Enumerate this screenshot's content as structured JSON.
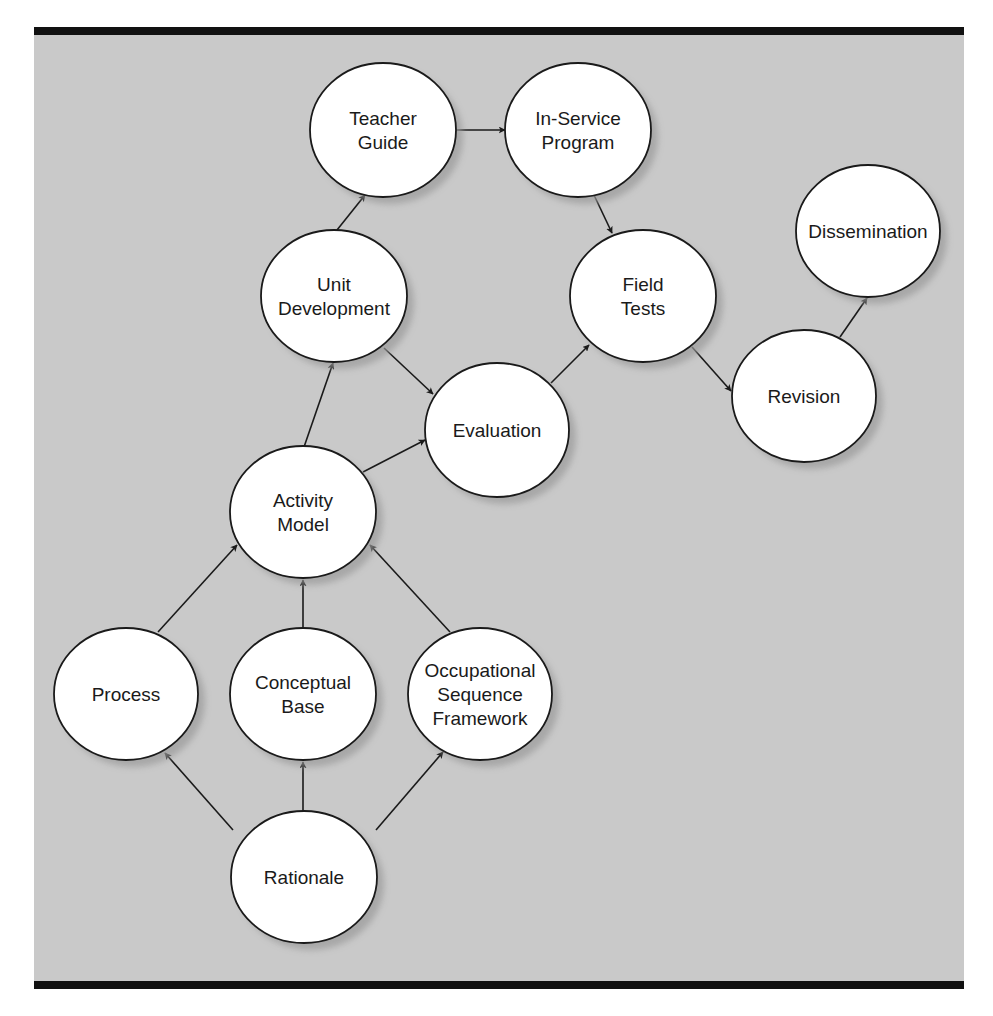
{
  "diagram": {
    "type": "flow-diagram",
    "colors": {
      "background": "#c9c9c9",
      "frame_bar": "#111111",
      "node_fill": "#ffffff",
      "node_stroke": "#1a1a1a",
      "shadow": "#9a9a9a",
      "arrow": "#1a1a1a"
    },
    "nodes": [
      {
        "id": "teacher-guide",
        "lines": [
          "Teacher",
          "Guide"
        ],
        "cx": 383,
        "cy": 130,
        "rx": 73,
        "ry": 67
      },
      {
        "id": "in-service-program",
        "lines": [
          "In-Service",
          "Program"
        ],
        "cx": 578,
        "cy": 130,
        "rx": 73,
        "ry": 67
      },
      {
        "id": "dissemination",
        "lines": [
          "Dissemination"
        ],
        "cx": 868,
        "cy": 231,
        "rx": 72,
        "ry": 66
      },
      {
        "id": "unit-development",
        "lines": [
          "Unit",
          "Development"
        ],
        "cx": 334,
        "cy": 296,
        "rx": 73,
        "ry": 66
      },
      {
        "id": "field-tests",
        "lines": [
          "Field",
          "Tests"
        ],
        "cx": 643,
        "cy": 296,
        "rx": 73,
        "ry": 66
      },
      {
        "id": "revision",
        "lines": [
          "Revision"
        ],
        "cx": 804,
        "cy": 396,
        "rx": 72,
        "ry": 66
      },
      {
        "id": "evaluation",
        "lines": [
          "Evaluation"
        ],
        "cx": 497,
        "cy": 430,
        "rx": 72,
        "ry": 67
      },
      {
        "id": "activity-model",
        "lines": [
          "Activity",
          "Model"
        ],
        "cx": 303,
        "cy": 512,
        "rx": 73,
        "ry": 66
      },
      {
        "id": "process",
        "lines": [
          "Process"
        ],
        "cx": 126,
        "cy": 694,
        "rx": 72,
        "ry": 66
      },
      {
        "id": "conceptual-base",
        "lines": [
          "Conceptual",
          "Base"
        ],
        "cx": 303,
        "cy": 694,
        "rx": 73,
        "ry": 66
      },
      {
        "id": "occupational-sequence-framework",
        "lines": [
          "Occupational",
          "Sequence",
          "Framework"
        ],
        "cx": 480,
        "cy": 694,
        "rx": 72,
        "ry": 66
      },
      {
        "id": "rationale",
        "lines": [
          "Rationale"
        ],
        "cx": 304,
        "cy": 877,
        "rx": 73,
        "ry": 66
      }
    ],
    "edges": [
      {
        "from": "teacher-guide",
        "to": "in-service-program",
        "x1": 457,
        "y1": 130,
        "x2": 505,
        "y2": 130
      },
      {
        "from": "in-service-program",
        "to": "field-tests",
        "x1": 594,
        "y1": 195,
        "x2": 612,
        "y2": 233
      },
      {
        "from": "unit-development",
        "to": "teacher-guide",
        "x1": 337,
        "y1": 230,
        "x2": 365,
        "y2": 195
      },
      {
        "from": "unit-development",
        "to": "evaluation",
        "x1": 384,
        "y1": 348,
        "x2": 433,
        "y2": 394
      },
      {
        "from": "activity-model",
        "to": "unit-development",
        "x1": 304,
        "y1": 447,
        "x2": 333,
        "y2": 363
      },
      {
        "from": "activity-model",
        "to": "evaluation",
        "x1": 363,
        "y1": 472,
        "x2": 425,
        "y2": 440
      },
      {
        "from": "evaluation",
        "to": "field-tests",
        "x1": 551,
        "y1": 383,
        "x2": 589,
        "y2": 345
      },
      {
        "from": "field-tests",
        "to": "revision",
        "x1": 692,
        "y1": 347,
        "x2": 731,
        "y2": 391
      },
      {
        "from": "revision",
        "to": "dissemination",
        "x1": 840,
        "y1": 337,
        "x2": 867,
        "y2": 298
      },
      {
        "from": "process",
        "to": "activity-model",
        "x1": 158,
        "y1": 632,
        "x2": 237,
        "y2": 545
      },
      {
        "from": "conceptual-base",
        "to": "activity-model",
        "x1": 303,
        "y1": 628,
        "x2": 303,
        "y2": 580
      },
      {
        "from": "occupational-sequence-framework",
        "to": "activity-model",
        "x1": 450,
        "y1": 632,
        "x2": 370,
        "y2": 545
      },
      {
        "from": "rationale",
        "to": "process",
        "x1": 233,
        "y1": 830,
        "x2": 165,
        "y2": 753
      },
      {
        "from": "rationale",
        "to": "conceptual-base",
        "x1": 303,
        "y1": 811,
        "x2": 303,
        "y2": 762
      },
      {
        "from": "rationale",
        "to": "occupational-sequence-framework",
        "x1": 376,
        "y1": 830,
        "x2": 443,
        "y2": 752
      }
    ]
  }
}
